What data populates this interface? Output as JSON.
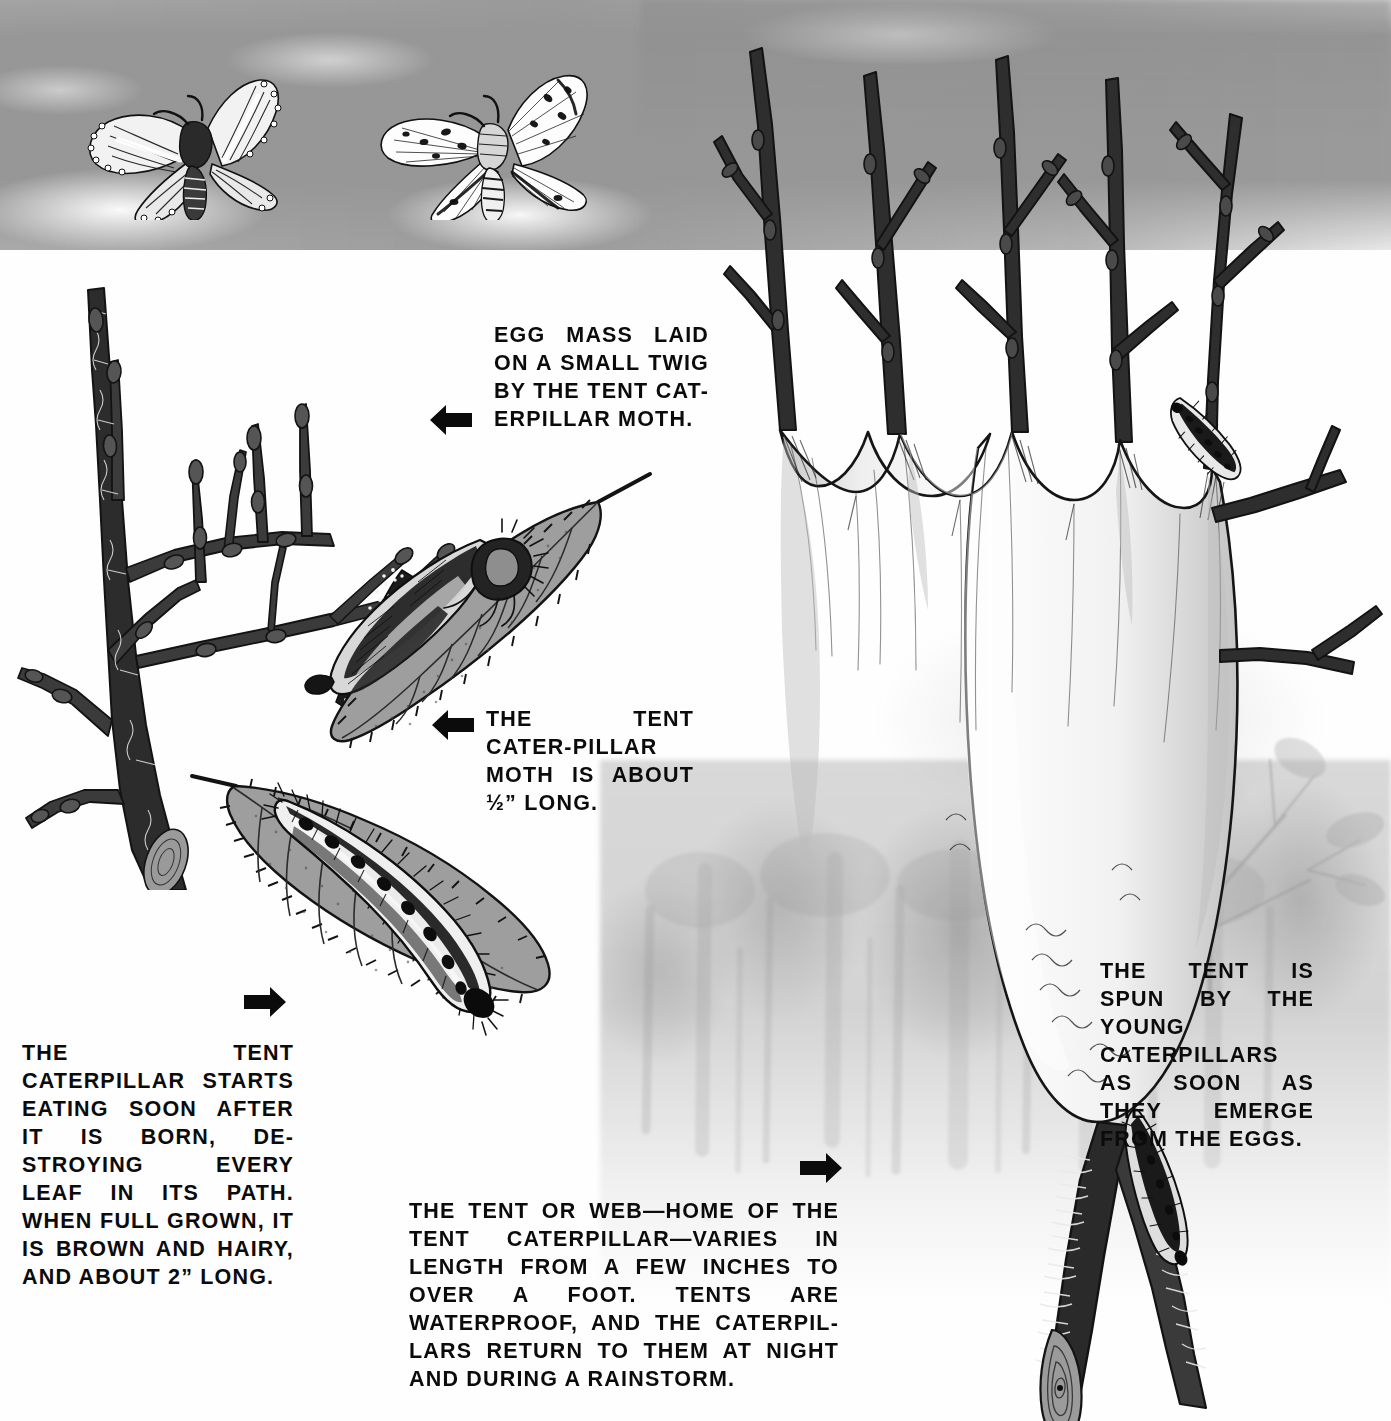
{
  "plate": {
    "title": "The Tent Caterpillar Life Cycle",
    "medium": "pen-and-ink and gray wash natural history illustration",
    "background_color": "#fefefe",
    "wash_gray": "#969696",
    "ink_black": "#0b0b0b"
  },
  "captions": {
    "egg_mass": "EGG MASS LAID ON A SMALL TWIG BY THE TENT CAT-ERPILLAR MOTH.",
    "moth": "THE TENT CATER-PILLAR MOTH IS ABOUT ½” LONG.",
    "caterpillar": "THE TENT CATERPILLAR STARTS EATING SOON AFTER IT IS BORN, DE-STROYING EVERY LEAF IN ITS PATH. WHEN FULL GROWN, IT IS BROWN AND HAIRY, AND ABOUT 2” LONG.",
    "tent_web": "THE TENT OR WEB—HOME OF THE TENT CATERPILLAR—VARIES IN LENGTH FROM A FEW INCHES TO OVER A FOOT. TENTS ARE WATERPROOF, AND THE CATERPIL-LARS RETURN TO THEM AT NIGHT AND DURING A RAINSTORM.",
    "tent_spun": "THE TENT IS SPUN BY THE YOUNG CATERPILLARS AS SOON AS THEY EMERGE FROM THE EGGS."
  },
  "figures": {
    "moth_dark": "dark moth with white wing stripes and dotted wing margins, in flight",
    "moth_pale": "pale moth with dark speckles on wings, in flight",
    "budded_branch": "bare branch with buds bearing the egg mass",
    "egg_mass": "dark granular egg collar encircling a small twig",
    "moth_on_leaf": "tent caterpillar moth resting on a serrated gray leaf",
    "caterpillar_on_leaf": "hairy caterpillar with a row of dark oval spots along a pale dorsal stripe, feeding on a leaf",
    "tent": "pale silken tent spun in the crotch of a branch, scalloped upper edges",
    "branch_stub": "cut branch stub showing growth rings",
    "caterpillar_on_twig": "caterpillar crawling on an upper right twig",
    "caterpillar_on_branch": "caterpillar crawling down the main branch"
  },
  "arrows": {
    "egg_mass": "left-arrow-icon",
    "moth": "left-arrow-icon",
    "caterpillar": "right-arrow-icon",
    "tent_web": "right-arrow-icon"
  }
}
